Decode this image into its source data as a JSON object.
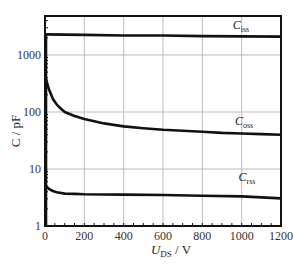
{
  "chart_data": {
    "type": "line",
    "title": "",
    "xlabel": "U_DS / V",
    "xlabel_main": "U",
    "xlabel_sub": "DS",
    "xlabel_unit": " / V",
    "ylabel": "C / pF",
    "xlim": [
      0,
      1200
    ],
    "ylim": [
      1,
      4800
    ],
    "yscale": "log",
    "grid": true,
    "x_ticks": [
      0,
      200,
      400,
      600,
      800,
      1000,
      1200
    ],
    "x_tick_labels": [
      "0",
      "200",
      "400",
      "600",
      "800",
      "1000",
      "1200"
    ],
    "y_ticks": [
      1,
      10,
      100,
      1000
    ],
    "y_tick_labels": [
      "1",
      "10",
      "100",
      "1000"
    ],
    "series": [
      {
        "name": "C_iss",
        "label_main": "C",
        "label_sub": "iss",
        "x": [
          0,
          5,
          200,
          400,
          600,
          800,
          1000,
          1200
        ],
        "values": [
          2300,
          2300,
          2250,
          2200,
          2200,
          2150,
          2120,
          2100
        ]
      },
      {
        "name": "C_oss",
        "label_main": "C",
        "label_sub": "oss",
        "x": [
          0,
          5,
          20,
          40,
          60,
          80,
          100,
          150,
          200,
          300,
          400,
          500,
          600,
          700,
          800,
          900,
          1000,
          1100,
          1200
        ],
        "values": [
          450,
          380,
          250,
          170,
          135,
          115,
          100,
          85,
          75,
          63,
          56,
          52,
          49,
          47,
          45,
          43,
          42,
          41,
          40
        ]
      },
      {
        "name": "C_rss",
        "label_main": "C",
        "label_sub": "rss",
        "x": [
          0,
          5,
          20,
          40,
          60,
          100,
          150,
          200,
          400,
          600,
          800,
          1000,
          1200
        ],
        "values": [
          6.0,
          5.0,
          4.5,
          4.1,
          3.9,
          3.7,
          3.65,
          3.6,
          3.55,
          3.5,
          3.4,
          3.3,
          3.05
        ]
      }
    ]
  }
}
